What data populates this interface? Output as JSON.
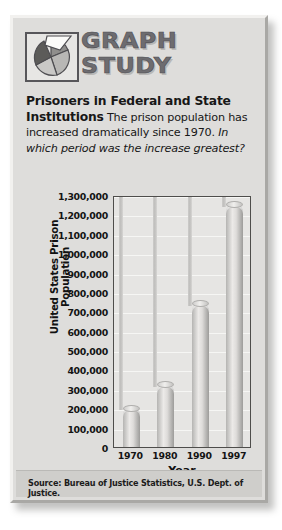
{
  "logo": {
    "line1": "GRAPH",
    "line2": "STUDY",
    "icon": "pie-chart-icon"
  },
  "caption": {
    "bold": "Prisoners in Federal and State Institutions",
    "body": "The prison population has increased dramatically since 1970.",
    "question": "In which period was the increase greatest?"
  },
  "source": {
    "text": "Source: Bureau of Justice Statistics, U.S. Dept. of Justice."
  },
  "colors": {
    "card_bg": "#dedddb",
    "plot_bg": "#e6e5e3",
    "bar_light": "#eceae8",
    "bar_dark": "#9d9c9a",
    "axis": "#4e4d4b",
    "gridline": "#f6f6f4",
    "text": "#141414"
  },
  "chart_data": {
    "type": "bar",
    "title": "Prisoners in Federal and State Institutions",
    "xlabel": "Year",
    "ylabel": "United States Prison Population",
    "categories": [
      "1970",
      "1980",
      "1990",
      "1997"
    ],
    "values": [
      200000,
      320000,
      740000,
      1250000
    ],
    "ylim": [
      0,
      1300000
    ],
    "ytick_values": [
      0,
      100000,
      200000,
      300000,
      400000,
      500000,
      600000,
      700000,
      800000,
      900000,
      1000000,
      1100000,
      1200000,
      1300000
    ],
    "ytick_labels": [
      "0",
      "100,000",
      "200,000",
      "300,000",
      "400,000",
      "500,000",
      "600,000",
      "700,000",
      "800,000",
      "900,000",
      "1,000,000",
      "1,100,000",
      "1,200,000",
      "1,300,000"
    ],
    "grid": true,
    "legend": false,
    "source": "Source: Bureau of Justice Statistics, U.S. Dept. of Justice."
  }
}
